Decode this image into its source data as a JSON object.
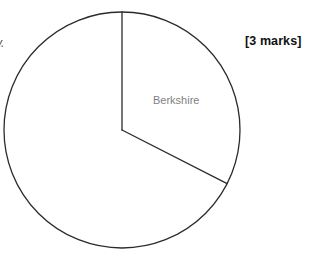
{
  "page": {
    "width": 315,
    "height": 257,
    "background_color": "#ffffff"
  },
  "marks_note": {
    "text": "[3 marks]",
    "color": "#111111"
  },
  "edge_fragment": {
    "text": "y."
  },
  "chart_data": {
    "type": "pie",
    "title": "",
    "categories": [
      "Berkshire",
      ""
    ],
    "values": [
      117,
      243
    ],
    "value_unit": "degrees",
    "labels": [
      "Berkshire",
      ""
    ],
    "legend": [],
    "legend_position": "none",
    "grid": false,
    "annotations": [
      "[3 marks]"
    ],
    "style": {
      "stroke_color": "#2b2b2b",
      "stroke_width": 1.3,
      "fill_color": "#ffffff",
      "label_color": "#7f7f7f"
    },
    "geometry": {
      "center_x": 122,
      "center_y": 130,
      "radius": 118,
      "start_angle_deg": 0,
      "slice_end_angle_deg": 117
    }
  }
}
